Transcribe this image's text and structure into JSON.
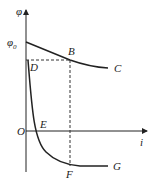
{
  "diagram": {
    "axes": {
      "y_label": "φ",
      "x_label": "i",
      "origin_label": "O",
      "y_intercept_label": "φ",
      "y_intercept_sub": "0",
      "y_intercept_sup": "0"
    },
    "points": {
      "B": "B",
      "C": "C",
      "D": "D",
      "E": "E",
      "F": "F",
      "G": "G"
    },
    "colors": {
      "line": "#222222",
      "dashed": "#333333"
    }
  }
}
